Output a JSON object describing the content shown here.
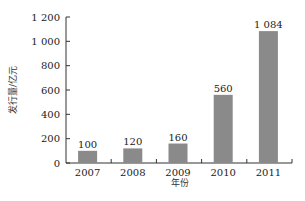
{
  "chart_data": {
    "type": "bar",
    "title": "",
    "xlabel": "年份",
    "ylabel": "发行量/亿元",
    "categories": [
      "2007",
      "2008",
      "2009",
      "2010",
      "2011"
    ],
    "values": [
      100,
      120,
      160,
      560,
      1084
    ],
    "value_labels": [
      "100",
      "120",
      "160",
      "560",
      "1 084"
    ],
    "ylim": [
      0,
      1200
    ],
    "yticks": [
      0,
      200,
      400,
      600,
      800,
      1000,
      1200
    ],
    "ytick_labels": [
      "0",
      "200",
      "400",
      "600",
      "800",
      "1 000",
      "1 200"
    ],
    "grid": false,
    "legend": null,
    "bar_color": "#8a8a8a"
  }
}
